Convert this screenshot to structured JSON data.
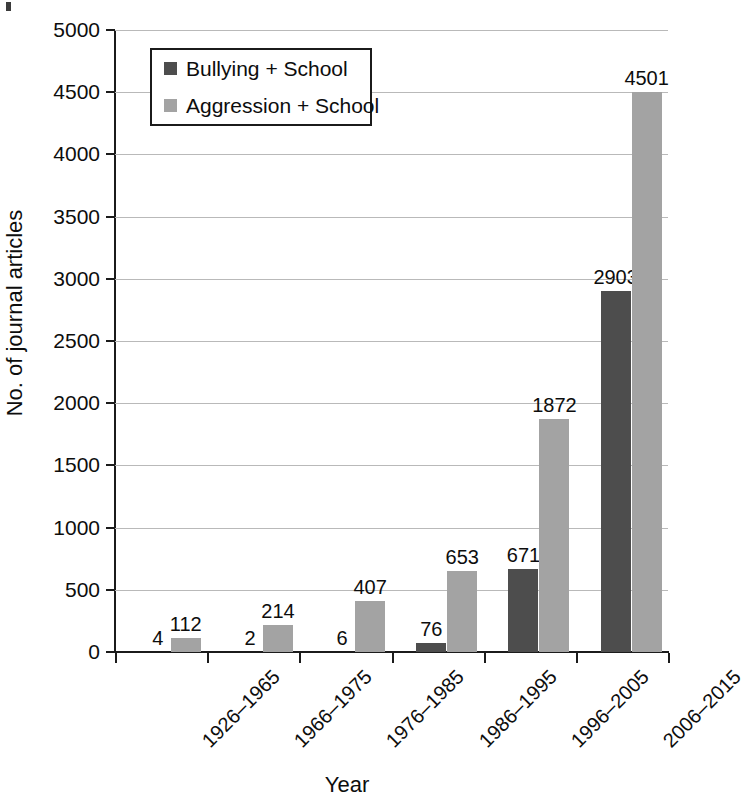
{
  "chart_data": {
    "type": "bar",
    "title": "",
    "xlabel": "Year",
    "ylabel": "No. of journal articles",
    "ylim": [
      0,
      5000
    ],
    "ytick_step": 500,
    "yticks": [
      "0",
      "500",
      "1000",
      "1500",
      "2000",
      "2500",
      "3000",
      "3500",
      "4000",
      "4500",
      "5000"
    ],
    "grid": true,
    "legend_position": "top-left-inside",
    "categories": [
      "1926–1965",
      "1966–1975",
      "1976–1985",
      "1986–1995",
      "1996–2005",
      "2006–2015"
    ],
    "series": [
      {
        "name": "Bullying + School",
        "color": "#4d4d4d",
        "values": [
          4,
          2,
          6,
          76,
          671,
          2903
        ],
        "labels": [
          "4",
          "2",
          "6",
          "76",
          "671",
          "2903"
        ]
      },
      {
        "name": "Aggression + School",
        "color": "#a3a3a3",
        "values": [
          112,
          214,
          407,
          653,
          1872,
          4501
        ],
        "labels": [
          "112",
          "214",
          "407",
          "653",
          "1872",
          "4501"
        ]
      }
    ]
  },
  "legend": {
    "items": [
      {
        "label": "Bullying + School",
        "color": "#4d4d4d"
      },
      {
        "label": "Aggression + School",
        "color": "#a3a3a3"
      }
    ]
  },
  "axes": {
    "y_title": "No. of journal articles",
    "x_title": "Year"
  },
  "colors": {
    "series_dark": "#4d4d4d",
    "series_light": "#a3a3a3",
    "axis": "#1b1b1b",
    "grid": "#b9b9b9",
    "text": "#0d0d0d",
    "background": "#ffffff"
  }
}
